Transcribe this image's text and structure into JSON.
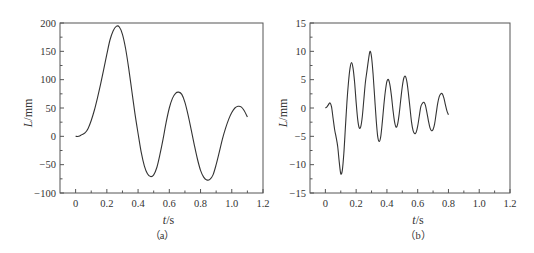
{
  "chart_data": [
    {
      "id": "a",
      "type": "line",
      "caption": "（a）",
      "xlabel_italic": "t",
      "xlabel_unit": "/s",
      "ylabel_italic": "L",
      "ylabel_unit": "/mm",
      "xlim": [
        -0.1,
        1.2
      ],
      "ylim": [
        -100,
        200
      ],
      "xticks": [
        0,
        0.2,
        0.4,
        0.6,
        0.8,
        1.0,
        1.2
      ],
      "xtick_labels": [
        "0",
        "0.2",
        "0.4",
        "0.6",
        "0.8",
        "1.0",
        "1.2"
      ],
      "yticks": [
        -100,
        -50,
        0,
        50,
        100,
        150,
        200
      ],
      "ytick_labels": [
        "−100",
        "−50",
        "0",
        "50",
        "100",
        "150",
        "200"
      ],
      "grid": false,
      "series": [
        {
          "name": "L",
          "x": [
            0,
            0.02,
            0.04,
            0.06,
            0.08,
            0.1,
            0.12,
            0.14,
            0.16,
            0.18,
            0.2,
            0.22,
            0.24,
            0.26,
            0.28,
            0.3,
            0.32,
            0.34,
            0.36,
            0.38,
            0.4,
            0.42,
            0.44,
            0.46,
            0.48,
            0.5,
            0.52,
            0.54,
            0.56,
            0.58,
            0.6,
            0.62,
            0.64,
            0.66,
            0.68,
            0.7,
            0.72,
            0.74,
            0.76,
            0.78,
            0.8,
            0.82,
            0.84,
            0.86,
            0.88,
            0.9,
            0.92,
            0.94,
            0.96,
            0.98,
            1.0,
            1.02,
            1.04,
            1.06,
            1.08,
            1.1,
            1.12,
            1.14,
            1.16,
            1.18,
            1.2
          ],
          "y": [
            0,
            0,
            3,
            6,
            14,
            28,
            46,
            68,
            92,
            118,
            145,
            170,
            186,
            194,
            193,
            180,
            155,
            120,
            80,
            40,
            5,
            -28,
            -52,
            -66,
            -71,
            -68,
            -55,
            -32,
            -5,
            25,
            50,
            67,
            76,
            78,
            74,
            60,
            38,
            12,
            -15,
            -40,
            -60,
            -72,
            -77,
            -76,
            -68,
            -50,
            -28,
            -5,
            14,
            30,
            42,
            50,
            53,
            52,
            45,
            34
          ]
        }
      ]
    },
    {
      "id": "b",
      "type": "line",
      "caption": "（b）",
      "xlabel_italic": "t",
      "xlabel_unit": "/s",
      "ylabel_italic": "L",
      "ylabel_unit": "/mm",
      "xlim": [
        -0.1,
        1.2
      ],
      "ylim": [
        -15,
        15
      ],
      "xticks": [
        0,
        0.2,
        0.4,
        0.6,
        0.8,
        1.0,
        1.2
      ],
      "xtick_labels": [
        "0",
        "0.2",
        "0.4",
        "0.6",
        "0.8",
        "1.0",
        "1.2"
      ],
      "yticks": [
        -15,
        -10,
        -5,
        0,
        5,
        10,
        15
      ],
      "ytick_labels": [
        "−15",
        "−10",
        "−5",
        "0",
        "5",
        "10",
        "15"
      ],
      "grid": false,
      "series": [
        {
          "name": "L",
          "x": [
            0,
            0.01,
            0.02,
            0.03,
            0.04,
            0.05,
            0.06,
            0.07,
            0.08,
            0.09,
            0.1,
            0.11,
            0.12,
            0.13,
            0.14,
            0.15,
            0.16,
            0.17,
            0.18,
            0.19,
            0.2,
            0.21,
            0.22,
            0.23,
            0.24,
            0.25,
            0.26,
            0.27,
            0.28,
            0.29,
            0.3,
            0.31,
            0.32,
            0.33,
            0.34,
            0.35,
            0.36,
            0.37,
            0.38,
            0.39,
            0.4,
            0.41,
            0.42,
            0.43,
            0.44,
            0.45,
            0.46,
            0.47,
            0.48,
            0.49,
            0.5,
            0.51,
            0.52,
            0.53,
            0.54,
            0.55,
            0.56,
            0.57,
            0.58,
            0.59,
            0.6,
            0.61,
            0.62,
            0.63,
            0.64,
            0.65,
            0.66,
            0.67,
            0.68,
            0.69,
            0.7,
            0.71,
            0.72,
            0.73,
            0.74,
            0.75,
            0.76,
            0.77,
            0.78,
            0.79,
            0.8,
            0.81,
            0.82,
            0.83,
            0.84,
            0.85,
            0.86,
            0.87,
            0.88,
            0.89,
            0.9,
            0.91,
            0.92,
            0.93,
            0.94,
            0.95,
            0.96,
            0.97,
            0.98,
            0.99,
            1.0,
            1.01,
            1.02,
            1.03,
            1.04,
            1.05,
            1.06,
            1.07,
            1.08,
            1.09,
            1.1,
            1.11,
            1.12,
            1.13,
            1.14,
            1.15,
            1.16,
            1.17,
            1.18,
            1.19,
            1.2
          ],
          "y": [
            0,
            0.2,
            0.6,
            0.9,
            0.2,
            -1.8,
            -3.8,
            -5.2,
            -6.8,
            -9.5,
            -11.6,
            -11.0,
            -8.0,
            -3.5,
            1.0,
            4.5,
            7.0,
            8.0,
            7.0,
            4.5,
            1.0,
            -2.0,
            -3.5,
            -3.3,
            -1.5,
            1.5,
            4.5,
            6.5,
            8.5,
            10.0,
            9.0,
            6.0,
            2.0,
            -2.0,
            -5.0,
            -5.9,
            -5.0,
            -2.5,
            0.5,
            3.0,
            4.7,
            5.0,
            4.0,
            2.0,
            -0.5,
            -2.5,
            -3.4,
            -2.8,
            -1.0,
            1.5,
            3.8,
            5.3,
            5.6,
            4.6,
            2.5,
            0,
            -2.5,
            -4.0,
            -4.5,
            -4.3,
            -3.2,
            -1.5,
            0.2,
            0.8,
            1.0,
            0.5,
            -0.8,
            -2.3,
            -3.5,
            -4.0,
            -3.8,
            -2.8,
            -1.0,
            0.8,
            2.0,
            2.5,
            2.5,
            1.8,
            0.6,
            -0.5,
            -1.2
          ]
        }
      ]
    }
  ]
}
